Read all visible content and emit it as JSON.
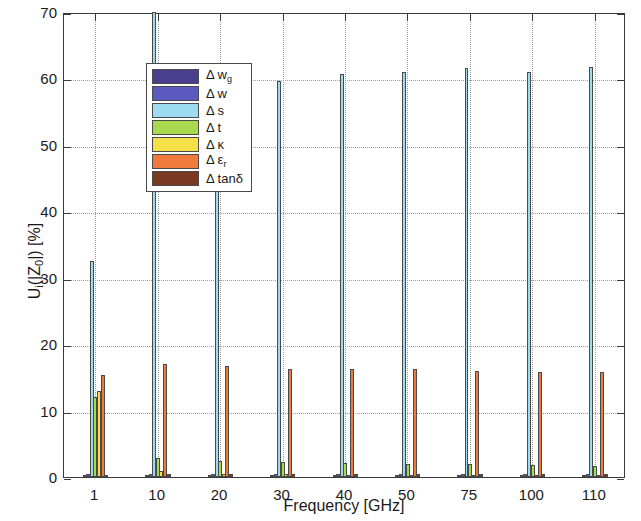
{
  "chart_data": {
    "type": "bar",
    "title": "",
    "xlabel": "Frequency [GHz]",
    "ylabel": "U_i(|Z_0|) [%]",
    "ylabel_parts": {
      "main1": "U",
      "sub1": "i",
      "main2": "(|Z",
      "sub2": "0",
      "main3": "|) [%]"
    },
    "categories": [
      "1",
      "10",
      "20",
      "30",
      "40",
      "50",
      "75",
      "100",
      "110"
    ],
    "ylim": [
      0,
      70
    ],
    "yticks": [
      0,
      10,
      20,
      30,
      40,
      50,
      60,
      70
    ],
    "grid": "dotted-both",
    "legend_position": "upper-left-inside",
    "series": [
      {
        "name": "Δ w_g",
        "label_main": "Δ w",
        "label_sub": "g",
        "color": "#4a3f8f",
        "values": [
          0.35,
          0.3,
          0.3,
          0.3,
          0.3,
          0.3,
          0.3,
          0.3,
          0.3
        ]
      },
      {
        "name": "Δ w",
        "label_main": "Δ w",
        "label_sub": "",
        "color": "#5a5ac0",
        "values": [
          0.5,
          0.45,
          0.45,
          0.4,
          0.4,
          0.4,
          0.4,
          0.4,
          0.4
        ]
      },
      {
        "name": "Δ s",
        "label_main": "Δ s",
        "label_sub": "",
        "color": "#9bdcf0",
        "values": [
          32.5,
          72.0,
          59.7,
          59.6,
          60.6,
          61.0,
          61.5,
          60.9,
          61.7
        ]
      },
      {
        "name": "Δ t",
        "label_main": "Δ t",
        "label_sub": "",
        "color": "#a8d94e",
        "values": [
          12.0,
          2.8,
          2.4,
          2.2,
          2.1,
          2.0,
          1.9,
          1.8,
          1.7
        ]
      },
      {
        "name": "Δ κ",
        "label_main": "Δ κ",
        "label_sub": "",
        "color": "#f5e04a",
        "values": [
          13.0,
          0.85,
          0.5,
          0.4,
          0.35,
          0.3,
          0.3,
          0.25,
          0.25
        ]
      },
      {
        "name": "Δ ε_r",
        "label_main": "Δ ε",
        "label_sub": "r",
        "color": "#f07a3c",
        "values": [
          15.3,
          17.0,
          16.7,
          16.2,
          16.2,
          16.2,
          16.0,
          15.8,
          15.8
        ]
      },
      {
        "name": "Δ tanδ",
        "label_main": "Δ tanδ",
        "label_sub": "",
        "color": "#7a3a22",
        "values": [
          0.35,
          0.4,
          0.45,
          0.45,
          0.5,
          0.5,
          0.5,
          0.5,
          0.5
        ]
      }
    ]
  },
  "axes": {
    "y_tick_labels": [
      "0",
      "10",
      "20",
      "30",
      "40",
      "50",
      "60",
      "70"
    ],
    "x_tick_labels": [
      "1",
      "10",
      "20",
      "30",
      "40",
      "50",
      "75",
      "100",
      "110"
    ],
    "x_axis_title": "Frequency [GHz]"
  }
}
